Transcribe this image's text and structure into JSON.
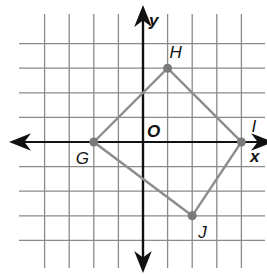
{
  "diagram": {
    "type": "coordinate-grid-quadrilateral",
    "axes": {
      "x_label": "x",
      "y_label": "y",
      "origin_label": "O"
    },
    "grid": {
      "x_min": -5,
      "x_max": 5,
      "y_min": -5,
      "y_max": 5,
      "unit_px": 24.6
    },
    "points": [
      {
        "name": "G",
        "x": -2,
        "y": 0
      },
      {
        "name": "H",
        "x": 1,
        "y": 3
      },
      {
        "name": "I",
        "x": 4,
        "y": 0
      },
      {
        "name": "J",
        "x": 2,
        "y": -3
      }
    ],
    "colors": {
      "grid": "#8a8a8a",
      "axis": "#111111",
      "polygon": "#8c8c8c",
      "point": "#7a7a7a"
    }
  }
}
